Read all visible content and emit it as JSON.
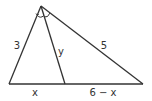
{
  "diagram": {
    "type": "triangle-angle-bisector",
    "colors": {
      "stroke": "#333333",
      "text": "#333333",
      "background": "#ffffff"
    },
    "points": {
      "apex": [
        41,
        6
      ],
      "left": [
        9,
        84
      ],
      "foot": [
        65,
        84
      ],
      "right": [
        143,
        84
      ]
    },
    "labels": {
      "left_side": "3",
      "bisector": "y",
      "right_side": "5",
      "base_left": "x",
      "base_right": "6 − x"
    },
    "angle_marks": {
      "count": 2,
      "meaning": "equal angles (bisected apex angle)"
    }
  }
}
